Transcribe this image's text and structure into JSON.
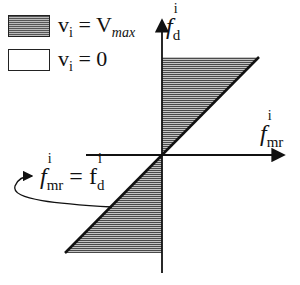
{
  "legend": {
    "items": [
      {
        "swatch": "hatched",
        "label_var": "v",
        "label_sub": "i",
        "label_eq": "=",
        "label_val": "V",
        "label_val_sub": "max"
      },
      {
        "swatch": "empty",
        "label_var": "v",
        "label_sub": "i",
        "label_eq": "=",
        "label_val": "0"
      }
    ]
  },
  "axes": {
    "y_label": {
      "main": "f",
      "sup": "i",
      "sub": "d"
    },
    "x_label": {
      "main": "f",
      "sup": "i",
      "sub": "mr"
    }
  },
  "annotation": {
    "lhs_main": "f",
    "lhs_sup": "i",
    "lhs_sub": "mr",
    "eq": "=",
    "rhs_main": "f",
    "rhs_sup": "i",
    "rhs_sub": "d"
  },
  "colors": {
    "hatch_dark": "#555555",
    "hatch_light": "#bbbbbb",
    "line": "#111111"
  }
}
